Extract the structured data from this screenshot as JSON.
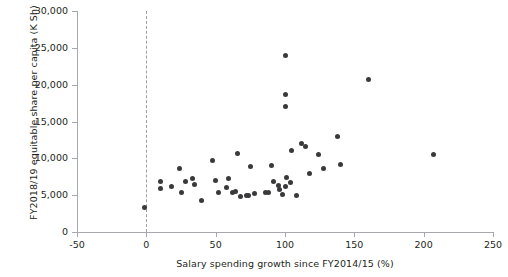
{
  "chart_data": {
    "type": "scatter",
    "title": "",
    "xlabel": "Salary spending growth since FY2014/15 (%)",
    "ylabel": "FY2018/19 equitable share per capita (K Sh)",
    "xlim": [
      -50,
      250
    ],
    "ylim": [
      0,
      30000
    ],
    "xticks": [
      -50,
      0,
      50,
      100,
      150,
      200,
      250
    ],
    "xtick_labels": [
      "-50",
      "0",
      "50",
      "100",
      "150",
      "200",
      "250"
    ],
    "yticks": [
      0,
      5000,
      10000,
      15000,
      20000,
      25000,
      30000
    ],
    "ytick_labels": [
      "0",
      "5,000",
      "10,000",
      "15,000",
      "20,000",
      "25,000",
      "30,000"
    ],
    "grid": false,
    "legend": null,
    "annotations": [
      {
        "name": "zero-reference-line",
        "type": "vline",
        "x": 0,
        "style": "dashed",
        "color": "#9e9e9e"
      }
    ],
    "marker": {
      "shape": "circle",
      "size": 5,
      "color": "#3a3a3c"
    },
    "points": [
      {
        "x": -1,
        "y": 3300
      },
      {
        "x": 10,
        "y": 6800
      },
      {
        "x": 10,
        "y": 5900
      },
      {
        "x": 18,
        "y": 6200
      },
      {
        "x": 24,
        "y": 8600
      },
      {
        "x": 25,
        "y": 5400
      },
      {
        "x": 28,
        "y": 6800
      },
      {
        "x": 33,
        "y": 7200
      },
      {
        "x": 35,
        "y": 6400
      },
      {
        "x": 40,
        "y": 4300
      },
      {
        "x": 48,
        "y": 9700
      },
      {
        "x": 50,
        "y": 7000
      },
      {
        "x": 52,
        "y": 5400
      },
      {
        "x": 58,
        "y": 6000
      },
      {
        "x": 59,
        "y": 7200
      },
      {
        "x": 62,
        "y": 5400
      },
      {
        "x": 64,
        "y": 5500
      },
      {
        "x": 66,
        "y": 10600
      },
      {
        "x": 68,
        "y": 4800
      },
      {
        "x": 72,
        "y": 4900
      },
      {
        "x": 74,
        "y": 5000
      },
      {
        "x": 75,
        "y": 8900
      },
      {
        "x": 78,
        "y": 5200
      },
      {
        "x": 86,
        "y": 5400
      },
      {
        "x": 88,
        "y": 5400
      },
      {
        "x": 90,
        "y": 9000
      },
      {
        "x": 92,
        "y": 6800
      },
      {
        "x": 95,
        "y": 6300
      },
      {
        "x": 96,
        "y": 5800
      },
      {
        "x": 98,
        "y": 5100
      },
      {
        "x": 100,
        "y": 24000
      },
      {
        "x": 100,
        "y": 18700
      },
      {
        "x": 100,
        "y": 17000
      },
      {
        "x": 100,
        "y": 6200
      },
      {
        "x": 101,
        "y": 7400
      },
      {
        "x": 104,
        "y": 6700
      },
      {
        "x": 105,
        "y": 11000
      },
      {
        "x": 108,
        "y": 5000
      },
      {
        "x": 112,
        "y": 12000
      },
      {
        "x": 115,
        "y": 11600
      },
      {
        "x": 118,
        "y": 8000
      },
      {
        "x": 124,
        "y": 10500
      },
      {
        "x": 128,
        "y": 8600
      },
      {
        "x": 138,
        "y": 12900
      },
      {
        "x": 140,
        "y": 9100
      },
      {
        "x": 160,
        "y": 20700
      },
      {
        "x": 207,
        "y": 10500
      }
    ]
  }
}
